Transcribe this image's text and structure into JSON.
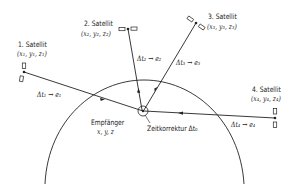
{
  "diagram": {
    "type": "gps-positioning",
    "colors": {
      "line": "#222222",
      "background": "#ffffff"
    },
    "satellites": [
      {
        "title": "1. Satellit",
        "coords": "(x₁, y₁, z₁)",
        "signal": "Δt₁ → e₁"
      },
      {
        "title": "2. Satellit",
        "coords": "(x₂, y₂, z₂)",
        "signal": "Δt₂ → e₂"
      },
      {
        "title": "3. Satellit",
        "coords": "(x₃, y₃, z₃)",
        "signal": "Δt₃ → e₃"
      },
      {
        "title": "4. Satellit",
        "coords": "(x₄, y₄, z₄)",
        "signal": "Δt₄ → e₄"
      }
    ],
    "receiver": {
      "title": "Empfänger",
      "coords": "x, y, z"
    },
    "clock_correction": "Zeitkorrektur Δt₀"
  }
}
